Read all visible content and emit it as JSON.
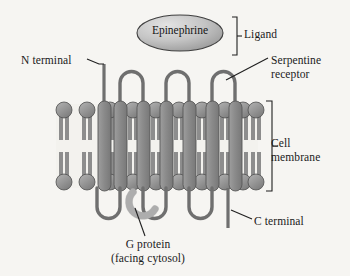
{
  "figure": {
    "type": "biology-diagram",
    "background_color": "#f6f5f2",
    "ink_color": "#1a1a1a"
  },
  "labels": {
    "epinephrine": "Epinephrine",
    "ligand": "Ligand",
    "n_terminal": "N terminal",
    "serpentine_receptor": "Serpentine\nreceptor",
    "serpentine_receptor_line1": "Serpentine",
    "serpentine_receptor_line2": "receptor",
    "cell_membrane_line1": "Cell",
    "cell_membrane_line2": "membrane",
    "c_terminal": "C terminal",
    "g_protein_line1": "G protein",
    "g_protein_line2": "(facing cytosol)"
  },
  "colors": {
    "protein_fill": "#8a8a8a",
    "protein_stroke": "#4a4a4a",
    "lipid_fill": "#9a9a9a",
    "lipid_stroke": "#4f4f4f",
    "g_protein_fill": "#b9b9b9",
    "g_protein_stroke": "#6e6e6e",
    "ellipse_fill_light": "#dedede",
    "ellipse_fill_dark": "#9b9b9b",
    "ellipse_stroke": "#3f3f3f",
    "leader_line": "#1f1f1f",
    "bracket": "#1f1f1f",
    "membrane_interior": "#f3f2ee"
  },
  "geometry": {
    "membrane_top_y": 104,
    "membrane_bottom_y": 188,
    "membrane_left_x": 56,
    "membrane_right_x": 258,
    "helix_count": 7,
    "extracellular_loop_count": 3,
    "intracellular_loop_count": 3,
    "helix_x_positions": [
      74,
      97,
      120,
      143,
      166,
      189,
      212
    ],
    "helix_width": 12
  },
  "brackets": {
    "ligand": {
      "x": 230,
      "y_top": 17,
      "y_bottom": 55
    },
    "cell_membrane": {
      "x": 266,
      "y_top": 101,
      "y_bottom": 191
    }
  },
  "ellipse": {
    "cx": 180,
    "cy": 33,
    "rx": 43,
    "ry": 18
  }
}
